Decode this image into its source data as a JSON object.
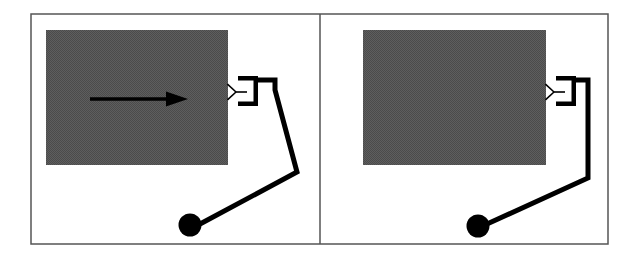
{
  "figure": {
    "title": "Two-panel illustration of a display with pointing device",
    "background_color": "#ffffff",
    "width": 644,
    "height": 260,
    "border": {
      "color": "#555555",
      "width": 1.5,
      "x": 31,
      "y": 14,
      "w": 577,
      "h": 230
    },
    "divider": {
      "color": "#555555",
      "width": 1.5,
      "x": 320,
      "y1": 14,
      "y2": 244
    }
  },
  "colors": {
    "screen_gray": "#5a5a5a",
    "screen_gray_dither": "#4e4e4e",
    "ink_black": "#000000",
    "frame_gray": "#555555",
    "paper_white": "#ffffff"
  },
  "panels": [
    {
      "id": "panel-left",
      "label": "left-panel",
      "screen": {
        "label": "display-screen",
        "x": 46,
        "y": 30,
        "w": 182,
        "h": 135,
        "fill": "#5a5a5a"
      },
      "arrow": {
        "label": "motion-arrow",
        "visible": true,
        "direction": "right",
        "x1": 90,
        "y1": 99,
        "x2": 188,
        "y2": 99,
        "shaft_width": 3.5,
        "head_length": 22,
        "head_width": 15,
        "color": "#000000"
      },
      "connector": {
        "label": "bracket-connector",
        "x": 238,
        "y": 76,
        "w": 20,
        "h": 30,
        "stroke_width": 4.5,
        "color": "#000000"
      },
      "antenna": {
        "label": "three-prong-marker",
        "cx": 236,
        "cy": 92,
        "size": 11,
        "stroke_width": 1.6,
        "color": "#000000"
      },
      "cable": {
        "label": "cable",
        "stroke_width": 5,
        "color": "#000000",
        "points": [
          [
            258,
            80
          ],
          [
            275,
            80
          ],
          [
            275,
            90
          ],
          [
            297,
            172
          ],
          [
            200,
            224
          ]
        ]
      },
      "puck": {
        "label": "pointing-device-puck",
        "cx": 190,
        "cy": 225,
        "r": 11.5,
        "fill": "#000000"
      }
    },
    {
      "id": "panel-right",
      "label": "right-panel",
      "screen": {
        "label": "display-screen",
        "x": 363,
        "y": 30,
        "w": 183,
        "h": 135,
        "fill": "#5a5a5a"
      },
      "arrow": {
        "label": "motion-arrow",
        "visible": false,
        "direction": "right",
        "x1": 0,
        "y1": 0,
        "x2": 0,
        "y2": 0,
        "shaft_width": 3.5,
        "head_length": 22,
        "head_width": 15,
        "color": "#000000"
      },
      "connector": {
        "label": "bracket-connector",
        "x": 556,
        "y": 76,
        "w": 20,
        "h": 30,
        "stroke_width": 4.5,
        "color": "#000000"
      },
      "antenna": {
        "label": "three-prong-marker",
        "cx": 554,
        "cy": 92,
        "size": 11,
        "stroke_width": 1.6,
        "color": "#000000"
      },
      "cable": {
        "label": "cable",
        "stroke_width": 5,
        "color": "#000000",
        "points": [
          [
            576,
            80
          ],
          [
            588,
            80
          ],
          [
            588,
            90
          ],
          [
            588,
            178
          ],
          [
            487,
            224
          ]
        ]
      },
      "puck": {
        "label": "pointing-device-puck",
        "cx": 478,
        "cy": 226,
        "r": 11.5,
        "fill": "#000000"
      }
    }
  ]
}
